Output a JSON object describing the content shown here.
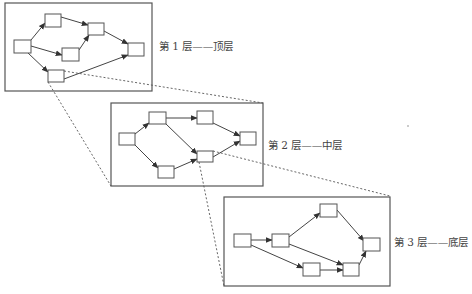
{
  "layers": [
    {
      "label": "第 1 层——顶层",
      "position": {
        "x": 159,
        "y": 38
      }
    },
    {
      "label": "第 2 层——中层",
      "position": {
        "x": 268,
        "y": 137
      }
    },
    {
      "label": "第 3 层——底层",
      "position": {
        "x": 394,
        "y": 234
      }
    }
  ],
  "colors": {
    "stroke": "#555555",
    "background": "#ffffff"
  }
}
